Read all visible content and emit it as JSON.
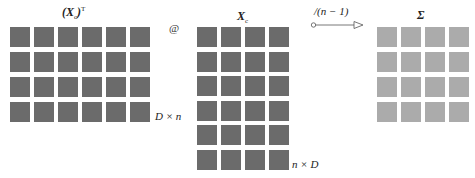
{
  "diagram": {
    "matrices": [
      {
        "id": "xc_transpose",
        "title_main": "(X",
        "title_sub": "c",
        "title_close": ")",
        "title_sup": "T",
        "rows": 4,
        "cols": 6,
        "dimension": "D × n",
        "shade": "#6b6b6b"
      },
      {
        "id": "xc",
        "title_main": "X",
        "title_sub": "c",
        "rows": 6,
        "cols": 4,
        "dimension": "n × D",
        "shade": "#6b6b6b"
      },
      {
        "id": "sigma",
        "title_main": "Σ",
        "rows": 4,
        "cols": 4,
        "shade": "#ababab"
      }
    ],
    "operator": "@",
    "arrow_label": "/(n − 1)"
  }
}
